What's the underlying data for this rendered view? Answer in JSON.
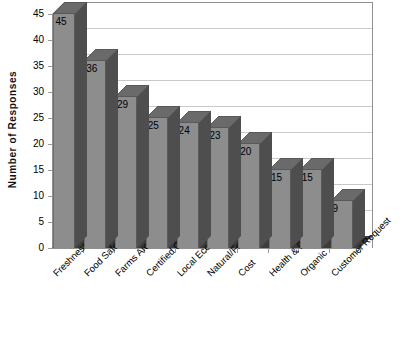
{
  "chart_data": {
    "type": "bar",
    "title": "",
    "subtitle": "",
    "xlabel": "",
    "ylabel": "Number of Responses",
    "ylim": [
      0,
      45
    ],
    "yticks": [
      0,
      5,
      10,
      15,
      20,
      25,
      30,
      35,
      40,
      45
    ],
    "grid": true,
    "legend": false,
    "legend_position": "none",
    "style_3d": true,
    "bar_color": "#8d8d8d",
    "bar_side_color": "#4e4e4e",
    "bar_top_color": "#6a6a6a",
    "gridline_color": "#c9c9c9",
    "axis_color": "#8f8f8f",
    "floor_color": "#3c3c3c",
    "background_color": "#ffffff",
    "xtick_rotation": -45,
    "categories": [
      "Freshness",
      "Food Safety",
      "Farms Around City",
      "Certified Organic",
      "Local Economy",
      "Natural/Few Chemicals",
      "Cost",
      "Health & Diet",
      "Organic",
      "Customer Request"
    ],
    "values": [
      45,
      36,
      29,
      25,
      24,
      23,
      20,
      15,
      15,
      9
    ],
    "data_labels": [
      "45",
      "36",
      "29",
      "25",
      "24",
      "23",
      "20",
      "15",
      "15",
      "9"
    ]
  }
}
